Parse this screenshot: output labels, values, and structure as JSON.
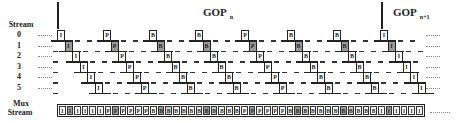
{
  "labels": {
    "stream_header": "Stream",
    "rows": [
      "0",
      "1",
      "2",
      "3",
      "4",
      "5"
    ],
    "mux_line1": "Mux",
    "mux_line2": "Stream"
  },
  "gops": [
    {
      "label": "GOP",
      "subscript": "n"
    },
    {
      "label": "GOP",
      "subscript": "n+1"
    }
  ],
  "groups": [
    {
      "type": "I",
      "gop": "n"
    },
    {
      "type": "P",
      "gop": "n"
    },
    {
      "type": "B",
      "gop": "n"
    },
    {
      "type": "B",
      "gop": "n"
    },
    {
      "type": "P",
      "gop": "n"
    },
    {
      "type": "B",
      "gop": "n"
    },
    {
      "type": "B",
      "gop": "n"
    },
    {
      "type": "I",
      "gop": "n+1"
    }
  ],
  "streams_per_group": 6,
  "mux_stream": [
    "I",
    "I",
    "I",
    "I",
    "I",
    "I",
    "P",
    "P",
    "P",
    "P",
    "P",
    "P",
    "B",
    "B",
    "B",
    "B",
    "B",
    "B",
    "B",
    "B",
    "B",
    "B",
    "B",
    "B",
    "P",
    "P",
    "P",
    "P",
    "P",
    "P",
    "B",
    "B",
    "B",
    "B",
    "B",
    "B",
    "B",
    "B",
    "B",
    "B",
    "B",
    "B",
    "I",
    "I",
    "I",
    "I",
    "I",
    "I"
  ],
  "colors": {
    "line": "#222222",
    "shaded_frame": "#9a9a9a",
    "background": "#ffffff"
  }
}
